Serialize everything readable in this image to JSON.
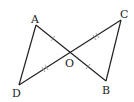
{
  "figure": {
    "points": {
      "A": {
        "label": "A",
        "x": 36,
        "y": 25
      },
      "B": {
        "label": "B",
        "x": 106,
        "y": 81
      },
      "C": {
        "label": "C",
        "x": 121,
        "y": 20
      },
      "D": {
        "label": "D",
        "x": 19,
        "y": 85
      },
      "O": {
        "label": "O",
        "x": 70,
        "y": 53
      }
    },
    "segments": [
      "AB",
      "CD",
      "AD",
      "CB"
    ],
    "equal_marks": {
      "single": [
        "AO",
        "OB"
      ],
      "double": [
        "CO",
        "OD"
      ]
    }
  }
}
